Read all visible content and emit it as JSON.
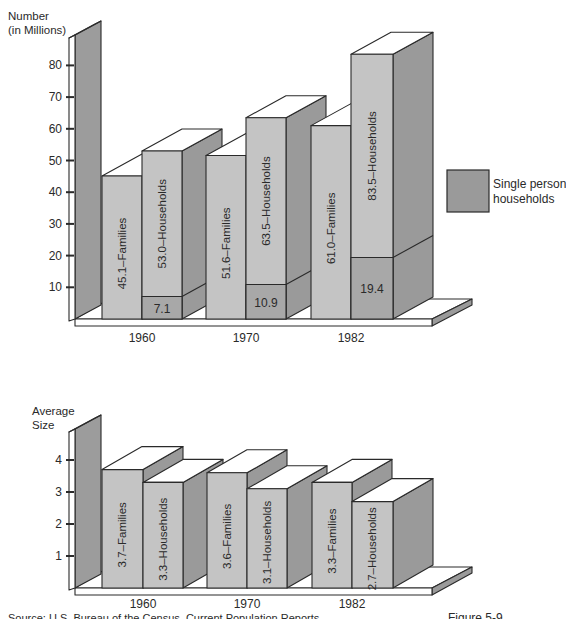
{
  "chart_data": [
    {
      "type": "bar",
      "title": "",
      "ylabel": "Number (in Millions)",
      "ylabel_lines": [
        "Number",
        "(in Millions)"
      ],
      "xlabel": "",
      "ylim": [
        0,
        90
      ],
      "yticks": [
        10,
        20,
        30,
        40,
        50,
        60,
        70,
        80
      ],
      "categories": [
        "1960",
        "1970",
        "1982"
      ],
      "style": "3d-columns",
      "grid": false,
      "series": [
        {
          "name": "Families",
          "values": [
            45.1,
            51.6,
            61.0
          ],
          "labels": [
            "45.1–Families",
            "51.6–Families",
            "61.0–Families"
          ]
        },
        {
          "name": "Households",
          "values": [
            53.0,
            63.5,
            83.5
          ],
          "labels": [
            "53.0–Households",
            "63.5–Households",
            "83.5–Households"
          ]
        },
        {
          "name": "Single person households",
          "values": [
            7.1,
            10.9,
            19.4
          ],
          "labels": [
            "7.1",
            "10.9",
            "19.4"
          ],
          "stacked_within": "Households"
        }
      ],
      "legend": {
        "position": "right",
        "entries": [
          {
            "label_lines": [
              "Single person",
              "households"
            ],
            "label": "Single person households",
            "color": "#9a9a9a"
          }
        ]
      }
    },
    {
      "type": "bar",
      "title": "",
      "ylabel": "Average Size",
      "ylabel_lines": [
        "Average",
        "Size"
      ],
      "xlabel": "",
      "ylim": [
        0,
        4.5
      ],
      "yticks": [
        1,
        2,
        3,
        4
      ],
      "categories": [
        "1960",
        "1970",
        "1982"
      ],
      "style": "3d-columns",
      "grid": false,
      "series": [
        {
          "name": "Families",
          "values": [
            3.7,
            3.6,
            3.3
          ],
          "labels": [
            "3.7–Families",
            "3.6–Families",
            "3.3–Families"
          ]
        },
        {
          "name": "Households",
          "values": [
            3.3,
            3.1,
            2.7
          ],
          "labels": [
            "3.3–Households",
            "3.1–Households",
            "2.7–Households"
          ]
        }
      ]
    }
  ],
  "footer": {
    "source": "Source: U.S. Bureau of the Census, Current Population Reports",
    "figure": "Figure 5-9"
  },
  "colors": {
    "face_light": "#c4c4c4",
    "side_dark": "#9a9a9a",
    "single_person": "#a8a8a8",
    "top": "#ffffff",
    "outline": "#2a2a2a",
    "wall": "#9c9c9c"
  }
}
